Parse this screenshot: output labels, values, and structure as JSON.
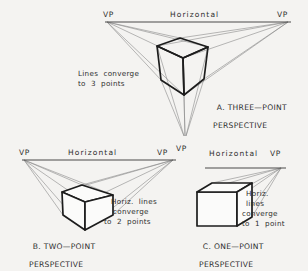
{
  "figure": {
    "background_color": "#f4f3f1",
    "ink_color": "#2e2e2e",
    "construction_line_color": "#8a8a8a"
  },
  "panels": [
    {
      "id": "A",
      "caption_line1": "A. THREE—POINT",
      "caption_line2": "PERSPECTIVE",
      "horizon_label": "Horizontal",
      "vp_left_label": "VP",
      "vp_right_label": "VP",
      "note_line1": "Lines  converge",
      "note_line2": "to  3  points",
      "vanishing_points": 3
    },
    {
      "id": "B",
      "caption_line1": "B. TWO—POINT",
      "caption_line2": "PERSPECTIVE",
      "horizon_label": "Horizontal",
      "vp_left_label": "VP",
      "vp_right_label": "VP",
      "note_line1": "Horiz.  lines",
      "note_line2": "converge",
      "note_line3": "to  2  points",
      "vanishing_points": 2
    },
    {
      "id": "C",
      "caption_line1": "C. ONE—POINT",
      "caption_line2": "PERSPECTIVE",
      "horizon_label": "Horizontal",
      "vp_left_label": "VP",
      "vp_right_label": "VP",
      "note_line1": "Horiz.",
      "note_line2": "lines",
      "note_line3": "converge",
      "note_line4": "to  1  point",
      "vanishing_points": 1
    }
  ]
}
